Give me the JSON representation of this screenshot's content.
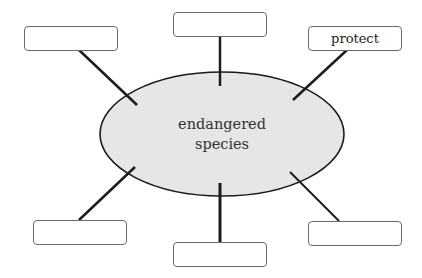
{
  "diagram": {
    "type": "spider-map",
    "center": {
      "line1": "endangered",
      "line2": "species",
      "fill": "#e6e6e6"
    },
    "boxes": [
      {
        "id": "top-left",
        "label": ""
      },
      {
        "id": "top",
        "label": ""
      },
      {
        "id": "top-right",
        "label": "protect"
      },
      {
        "id": "bottom-left",
        "label": ""
      },
      {
        "id": "bottom",
        "label": ""
      },
      {
        "id": "bottom-right",
        "label": ""
      }
    ]
  }
}
